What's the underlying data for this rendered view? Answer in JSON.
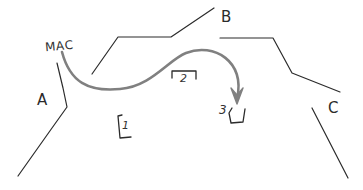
{
  "diagram": {
    "title_text": "MAC",
    "background_color": "#ffffff",
    "ink_color": "#2b2b2b",
    "arrow_color": "#808080",
    "labels": {
      "mac": "MAC",
      "region_a": "A",
      "region_b": "B",
      "region_c": "C",
      "marker_1": "1",
      "marker_2": "2",
      "marker_3": "3"
    },
    "strokes": {
      "left_ridge": "M57,63 L63,88 L67,107 L52,128 L18,176",
      "middle_ridge": "M92,74 L118,37 L171,37 L214,8",
      "right_ridge": "M220,38 L273,38 L292,73 L340,92",
      "right_tail": "M312,108 L348,178",
      "arrow_curve": "M62,52 C70,82 88,92 120,89 C152,86 168,60 186,53 C214,42 246,62 237,98",
      "arrow_head": "M231,88 L237,104 L243,88 L237,95 Z",
      "bracket_1": "M122,115 L118,116 L120,138 L131,137",
      "bracket_2": "M172,71 L172,78 M172,71 L196,71 M196,71 L196,79",
      "bracket_3": "M232,108 L229,113 L231,123 L243,122 L245,109"
    }
  }
}
